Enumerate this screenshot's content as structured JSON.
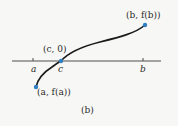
{
  "figure": {
    "caption": "(b)",
    "colors": {
      "axis": "#3a3a3a",
      "curve": "#1a1a1a",
      "point": "#2f7fc1",
      "text": "#2a2a2a",
      "background": "#f7f7f5"
    },
    "axis": {
      "ticks": [
        {
          "name": "a",
          "label": "a"
        },
        {
          "name": "c",
          "label": "c"
        },
        {
          "name": "b",
          "label": "b"
        }
      ]
    },
    "points": [
      {
        "name": "a-fa",
        "label": "(a, f(a))"
      },
      {
        "name": "c-0",
        "label": "(c, 0)"
      },
      {
        "name": "b-fb",
        "label": "(b, f(b))"
      }
    ]
  }
}
